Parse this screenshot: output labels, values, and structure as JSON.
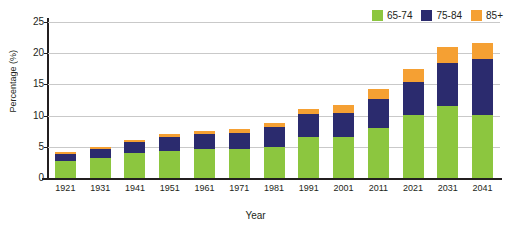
{
  "chart_data": {
    "type": "bar",
    "stacked": true,
    "title": "",
    "xlabel": "Year",
    "ylabel": "Percentage (%)",
    "categories": [
      "1921",
      "1931",
      "1941",
      "1951",
      "1961",
      "1971",
      "1981",
      "1991",
      "2001",
      "2011",
      "2021",
      "2031",
      "2041"
    ],
    "series": [
      {
        "name": "65-74",
        "color": "#8CC63F",
        "values": [
          2.7,
          3.2,
          4.0,
          4.4,
          4.6,
          4.7,
          5.0,
          6.6,
          6.5,
          8.0,
          10.1,
          11.5,
          10.1
        ]
      },
      {
        "name": "75-84",
        "color": "#2B2B6E",
        "values": [
          1.2,
          1.4,
          1.8,
          2.2,
          2.4,
          2.5,
          3.2,
          3.6,
          4.0,
          4.7,
          5.3,
          7.0,
          8.9
        ]
      },
      {
        "name": "85+",
        "color": "#F5A033",
        "values": [
          0.2,
          0.3,
          0.3,
          0.4,
          0.5,
          0.6,
          0.7,
          0.9,
          1.2,
          1.6,
          2.1,
          2.5,
          2.7
        ]
      }
    ],
    "totals": [
      4.1,
      4.9,
      6.1,
      7.0,
      7.5,
      7.8,
      8.9,
      11.1,
      11.7,
      14.3,
      17.5,
      21.0,
      21.7
    ],
    "yticks": [
      0,
      5,
      10,
      15,
      20,
      25
    ],
    "ylim": [
      0,
      25
    ],
    "grid": true,
    "legend_position": "top-right",
    "legend": [
      "65-74",
      "75-84",
      "85+"
    ]
  },
  "legend": {
    "items": [
      {
        "label": "65-74",
        "color": "#8CC63F"
      },
      {
        "label": "75-84",
        "color": "#2B2B6E"
      },
      {
        "label": "85+",
        "color": "#F5A033"
      }
    ]
  },
  "axes": {
    "y_title": "Percentage (%)",
    "x_title": "Year",
    "y_ticks": [
      "25",
      "20",
      "15",
      "10",
      "5",
      "0"
    ],
    "x_ticks": [
      "1921",
      "1931",
      "1941",
      "1951",
      "1961",
      "1971",
      "1981",
      "1991",
      "2001",
      "2011",
      "2021",
      "2031",
      "2041"
    ]
  },
  "colors": {
    "series_65_74": "#8CC63F",
    "series_75_84": "#2B2B6E",
    "series_85_plus": "#F5A033",
    "axis": "#231f20",
    "grid": "#c9c9c9",
    "background": "#ffffff"
  }
}
